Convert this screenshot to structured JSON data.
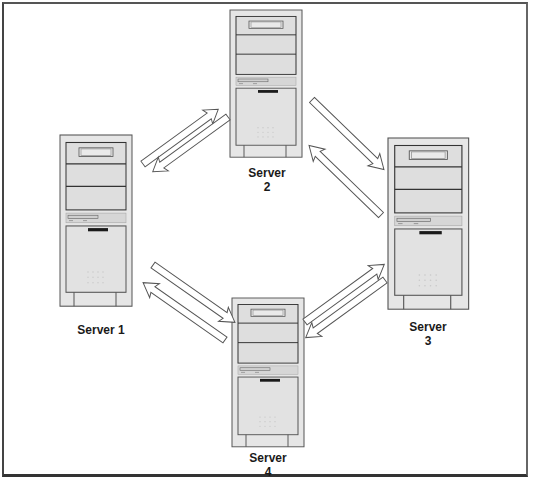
{
  "diagram": {
    "type": "network-topology",
    "colors": {
      "border": "#444444",
      "tower_fill": "#e4e4e4",
      "tower_stroke": "#555555",
      "bay_fill": "#dcdcdc",
      "arrow_fill": "#ffffff",
      "arrow_stroke": "#555555",
      "label_text": "#1a1a1a"
    },
    "servers": [
      {
        "id": "server-1",
        "label_line1": "Server 1",
        "label_line2": ""
      },
      {
        "id": "server-2",
        "label_line1": "Server",
        "label_line2": "2"
      },
      {
        "id": "server-3",
        "label_line1": "Server",
        "label_line2": "3"
      },
      {
        "id": "server-4",
        "label_line1": "Server",
        "label_line2": "4"
      }
    ],
    "connections": [
      {
        "from": "Server 1",
        "to": "Server 2",
        "direction": "bidirectional"
      },
      {
        "from": "Server 2",
        "to": "Server 3",
        "direction": "bidirectional"
      },
      {
        "from": "Server 3",
        "to": "Server 4",
        "direction": "bidirectional"
      },
      {
        "from": "Server 4",
        "to": "Server 1",
        "direction": "bidirectional"
      }
    ]
  }
}
